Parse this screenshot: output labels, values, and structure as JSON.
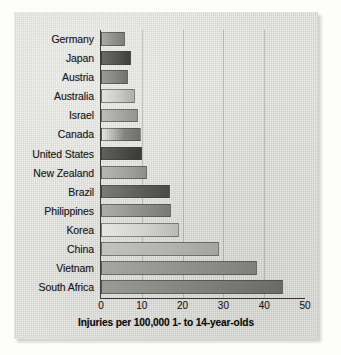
{
  "chart_data": {
    "type": "bar",
    "orientation": "horizontal",
    "title": "",
    "xlabel": "Injuries per 100,000 1- to 14-year-olds",
    "ylabel": "",
    "categories": [
      "Germany",
      "Japan",
      "Austria",
      "Australia",
      "Israel",
      "Canada",
      "United States",
      "New Zealand",
      "Brazil",
      "Philippines",
      "Korea",
      "China",
      "Vietnam",
      "South Africa"
    ],
    "values": [
      5.9,
      7.3,
      6.7,
      8.3,
      9.0,
      9.7,
      10.0,
      11.2,
      16.8,
      17.2,
      19.0,
      29.0,
      38.2,
      44.5
    ],
    "xlim": [
      0,
      50
    ],
    "xticks": [
      0,
      10,
      20,
      30,
      40,
      50
    ],
    "xtick_labels": [
      "0",
      "10",
      "20",
      "30",
      "40",
      "50"
    ],
    "gridlines": [
      10,
      20,
      30,
      40
    ],
    "grid": true,
    "legend": false,
    "bar_fills": [
      "linear-gradient(90deg, #a9a9a6 0%, #8f8f8c 55%, #7e7e7b 100%)",
      "linear-gradient(90deg, #6a6a68 0%, #525250 60%, #3e3e3c 100%)",
      "linear-gradient(90deg, #9a9a97 0%, #84847f 60%, #707070 100%)",
      "linear-gradient(90deg, #e2e2df 0%, #c9c9c5 55%, #aeaeaa 100%)",
      "linear-gradient(90deg, #bdbdb9 0%, #a5a5a1 55%, #949491 100%)",
      "linear-gradient(90deg, #9c9c99 0%, #86868300 0%, #838380 60%, #6f6f6c 100%)",
      "linear-gradient(90deg, #5f5f5d 0%, #4a4a48 55%, #3a3a38 100%)",
      "linear-gradient(90deg, #b6b6b2 0%, #a0a09c 60%, #8d8d8a 100%)",
      "linear-gradient(90deg, #7b7b78 0%, #5e5e5c 55%, #4a4a48 100%)",
      "linear-gradient(90deg, #adadaa 0%, #90908d 55%, #797976 100%)",
      "linear-gradient(90deg, #e6e6e3 0%, #d2d2ce 55%, #b9b9b5 100%)",
      "linear-gradient(90deg, #c2c2be 0%, #b2b2ae 60%, #a3a39f 100%)",
      "linear-gradient(90deg, #a6a6a2 0%, #90908c 55%, #7f7f7c 100%)",
      "linear-gradient(90deg, #9a9a96 0%, #828280 50%, #6a6a67 100%)"
    ]
  }
}
